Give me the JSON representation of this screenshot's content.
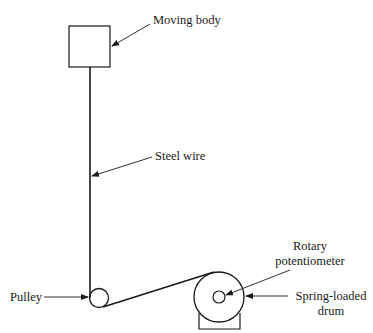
{
  "diagram": {
    "type": "mechanical-schematic",
    "components": {
      "moving_body": "Moving body",
      "steel_wire": "Steel wire",
      "pulley": "Pulley",
      "rotary_potentiometer_line1": "Rotary",
      "rotary_potentiometer_line2": "potentiometer",
      "drum_line1": "Spring-loaded",
      "drum_line2": "drum"
    },
    "colors": {
      "stroke": "#1a1a1a",
      "background": "#ffffff"
    }
  }
}
